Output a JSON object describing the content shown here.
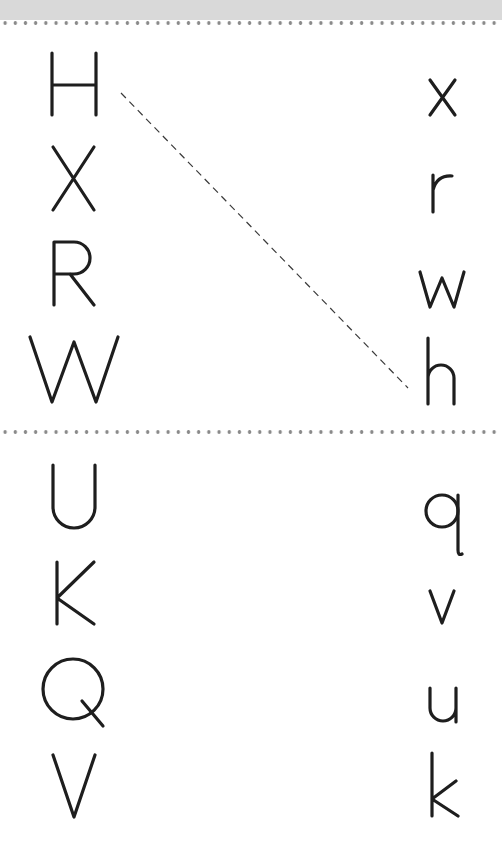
{
  "worksheet": {
    "type": "letter-matching",
    "sections": [
      {
        "uppercase": [
          "H",
          "X",
          "R",
          "W"
        ],
        "lowercase": [
          "x",
          "r",
          "w",
          "h"
        ],
        "example_match": {
          "from": "H",
          "to": "h"
        }
      },
      {
        "uppercase": [
          "U",
          "K",
          "Q",
          "V"
        ],
        "lowercase": [
          "q",
          "v",
          "u",
          "k"
        ]
      }
    ],
    "colors": {
      "ink": "#1e1e1e",
      "dots": "#8a8a8a",
      "top_band": "#d9d9d9",
      "background": "#ffffff"
    }
  }
}
